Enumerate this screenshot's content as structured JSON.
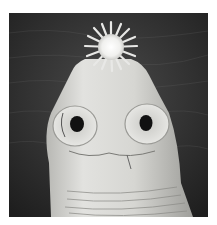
{
  "image": {
    "subject": "scanning electron micrograph of a tapeworm scolex",
    "description": "Grayscale close-up of a tapeworm head showing a crown of hooks (rostellum) on top and two round suckers on the front, against a dark textured background",
    "colors": {
      "background_border": "#ffffff",
      "backdrop": "#2e2e2e",
      "body": "#d9d9d6",
      "body_shadow": "#a8a8a4",
      "sucker_hole": "#111111",
      "hook_crown": "#f4f4f2"
    }
  }
}
